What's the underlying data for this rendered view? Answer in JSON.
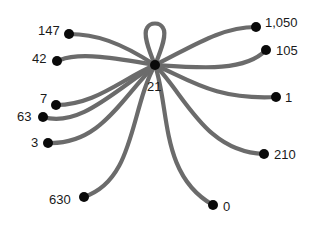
{
  "diagram": {
    "type": "star-graph",
    "edge_color": "#6b6b6b",
    "node_color": "#0a0a0a",
    "center": {
      "label": "21",
      "has_self_loop": true
    },
    "leaves": [
      {
        "label": "147"
      },
      {
        "label": "42"
      },
      {
        "label": "7"
      },
      {
        "label": "63"
      },
      {
        "label": "3"
      },
      {
        "label": "630"
      },
      {
        "label": "0"
      },
      {
        "label": "210"
      },
      {
        "label": "1"
      },
      {
        "label": "105"
      },
      {
        "label": "1,050"
      }
    ]
  }
}
